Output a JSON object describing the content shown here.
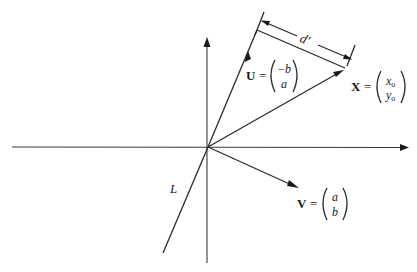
{
  "figure": {
    "labels": {
      "U": {
        "name": "U",
        "eq": "=",
        "top": "−b",
        "bottom": "a"
      },
      "X": {
        "name": "X",
        "eq": "=",
        "top": "x",
        "top_sub": "o",
        "bottom": "y",
        "bottom_sub": "o"
      },
      "V": {
        "name": "V",
        "eq": "=",
        "top": "a",
        "bottom": "b"
      },
      "L": "L",
      "d": "d′"
    },
    "colors": {
      "ink": "#1a1a1a",
      "background": "#ffffff"
    }
  }
}
